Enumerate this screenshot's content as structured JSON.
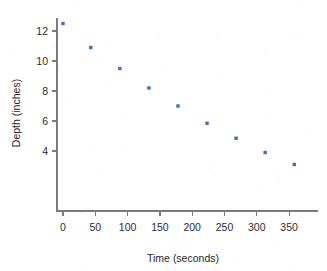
{
  "chart_data": {
    "type": "scatter",
    "title": "",
    "subtitle": "",
    "xlabel": "Time (seconds)",
    "ylabel": "Depth (inches)",
    "x": [
      0,
      43,
      88,
      133,
      178,
      223,
      268,
      313,
      358
    ],
    "values": [
      12.5,
      10.9,
      9.5,
      8.2,
      7.0,
      5.85,
      4.85,
      3.9,
      3.1
    ],
    "points": [
      {
        "x": 0,
        "y": 12.5
      },
      {
        "x": 43,
        "y": 10.9
      },
      {
        "x": 88,
        "y": 9.5
      },
      {
        "x": 133,
        "y": 8.2
      },
      {
        "x": 178,
        "y": 7.0
      },
      {
        "x": 223,
        "y": 5.85
      },
      {
        "x": 268,
        "y": 4.85
      },
      {
        "x": 313,
        "y": 3.9
      },
      {
        "x": 358,
        "y": 3.1
      }
    ],
    "xticks": [
      0,
      50,
      100,
      150,
      200,
      250,
      300,
      350
    ],
    "xtick_labels": [
      "0",
      "50",
      "100",
      "150",
      "200",
      "250",
      "300",
      "350"
    ],
    "yticks": [
      4,
      6,
      8,
      10,
      12
    ],
    "ytick_labels": [
      "4",
      "6",
      "8",
      "10",
      "12"
    ],
    "xlim": [
      -10,
      390
    ],
    "ylim": [
      2.2,
      13.2
    ],
    "grid": false,
    "legend": null,
    "legend_position": "none",
    "annotations": [],
    "series": [
      {
        "name": "Depth over time",
        "marker": "square",
        "color": "#3f6fc0",
        "values": [
          12.5,
          10.9,
          9.5,
          8.2,
          7.0,
          5.85,
          4.85,
          3.9,
          3.1
        ]
      }
    ],
    "colors": {
      "marker": "#3f6fc0",
      "axis": "#7a7a7f",
      "text": "#1f1f24",
      "background": "#ffffff"
    }
  }
}
